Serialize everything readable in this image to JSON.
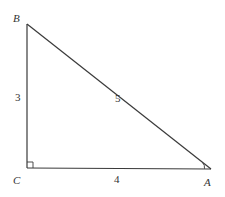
{
  "diagram": {
    "type": "right-triangle",
    "vertices": {
      "B": {
        "label": "B",
        "x": 27,
        "y": 24
      },
      "C": {
        "label": "C",
        "x": 27,
        "y": 168
      },
      "A": {
        "label": "A",
        "x": 211,
        "y": 169
      }
    },
    "sides": {
      "BC": {
        "label": "3"
      },
      "AB": {
        "label": "5"
      },
      "CA": {
        "label": "4"
      }
    },
    "right_angle_at": "C",
    "marked_angle_at": "A",
    "colors": {
      "stroke": "#3a3a3a",
      "text": "#333333",
      "background": "#ffffff"
    }
  }
}
